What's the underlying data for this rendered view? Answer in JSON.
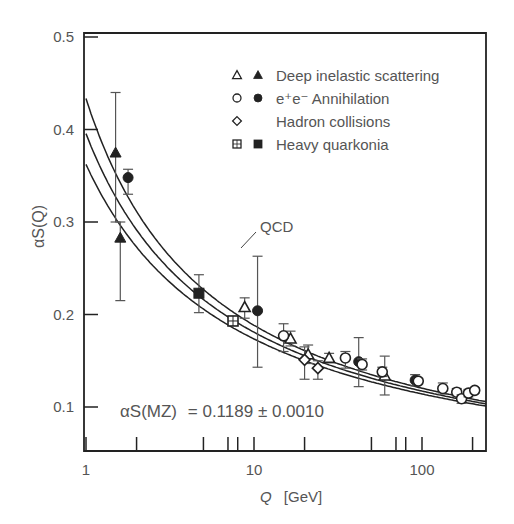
{
  "chart_data": {
    "type": "scatter",
    "title": "",
    "xlabel": "Q [GeV]",
    "xlabel_var": "Q",
    "xlabel_unit": "[GeV]",
    "ylabel": "αS(Q)",
    "xscale": "log",
    "xlim": [
      1,
      250
    ],
    "ylim": [
      0.05,
      0.5
    ],
    "grid": false,
    "x_tick_labels": [
      "1",
      "10",
      "100"
    ],
    "x_ticks": [
      1,
      10,
      100
    ],
    "x_minor_ticks": [
      2,
      5,
      7,
      8,
      20,
      50,
      70,
      80,
      200
    ],
    "y_tick_labels": [
      "0.5",
      "0.4",
      "0.3",
      "0.2",
      "0.1"
    ],
    "y_ticks": [
      0.5,
      0.4,
      0.3,
      0.2,
      0.1
    ],
    "curve_label": "QCD",
    "annotation": {
      "lhs": "αS(MZ)",
      "rhs": "= 0.1189 ± 0.0010",
      "alpha_mz": 0.1189,
      "uncertainty": 0.001
    },
    "qcd_band": {
      "alpha_mz": 0.1189,
      "uncertainty": 0.001,
      "mz": 91.19,
      "lines": 3
    },
    "legend_position": "upper right",
    "legend": [
      {
        "label": "Deep inelastic scattering",
        "markers": [
          "open-triangle",
          "filled-triangle"
        ]
      },
      {
        "label": "e⁺e⁻ Annihilation",
        "markers": [
          "open-circle",
          "filled-circle"
        ]
      },
      {
        "label": "Hadron collisions",
        "markers": [
          "open-diamond"
        ]
      },
      {
        "label": "Heavy quarkonia",
        "markers": [
          "crossed-square",
          "filled-square"
        ]
      }
    ],
    "series": [
      {
        "name": "Deep inelastic scattering",
        "points": [
          {
            "q": 1.5,
            "alpha": 0.375,
            "err_hi": 0.44,
            "err_lo": 0.3,
            "marker": "filled-triangle"
          },
          {
            "q": 1.6,
            "alpha": 0.283,
            "err_hi": 0.3,
            "err_lo": 0.215,
            "marker": "filled-triangle"
          },
          {
            "q": 8.8,
            "alpha": 0.208,
            "err_hi": 0.218,
            "err_lo": 0.196,
            "marker": "open-triangle"
          },
          {
            "q": 16.5,
            "alpha": 0.174,
            "err_hi": 0.182,
            "err_lo": 0.166,
            "marker": "open-triangle"
          },
          {
            "q": 21,
            "alpha": 0.157,
            "err_hi": 0.167,
            "err_lo": 0.147,
            "marker": "open-triangle"
          },
          {
            "q": 28,
            "alpha": 0.153,
            "err_hi": 0.158,
            "err_lo": 0.148,
            "marker": "open-triangle"
          },
          {
            "q": 60,
            "alpha": 0.134,
            "err_hi": 0.155,
            "err_lo": 0.113,
            "marker": "open-triangle"
          }
        ]
      },
      {
        "name": "e+e- Annihilation",
        "points": [
          {
            "q": 1.78,
            "alpha": 0.348,
            "err_hi": 0.357,
            "err_lo": 0.33,
            "marker": "filled-circle"
          },
          {
            "q": 10.5,
            "alpha": 0.204,
            "err_hi": 0.263,
            "err_lo": 0.143,
            "marker": "filled-circle"
          },
          {
            "q": 15,
            "alpha": 0.177,
            "err_hi": 0.19,
            "err_lo": 0.16,
            "marker": "open-circle"
          },
          {
            "q": 35,
            "alpha": 0.153,
            "err_hi": 0.16,
            "err_lo": 0.142,
            "marker": "open-circle"
          },
          {
            "q": 42,
            "alpha": 0.149,
            "err_hi": 0.175,
            "err_lo": 0.122,
            "marker": "filled-circle"
          },
          {
            "q": 44,
            "alpha": 0.146,
            "err_hi": 0.152,
            "err_lo": 0.14,
            "marker": "open-circle"
          },
          {
            "q": 58,
            "alpha": 0.138,
            "err_hi": 0.143,
            "err_lo": 0.133,
            "marker": "open-circle"
          },
          {
            "q": 91,
            "alpha": 0.129,
            "err_hi": 0.135,
            "err_lo": 0.123,
            "marker": "filled-circle"
          },
          {
            "q": 95,
            "alpha": 0.128,
            "err_hi": 0.131,
            "err_lo": 0.125,
            "marker": "open-circle"
          },
          {
            "q": 133,
            "alpha": 0.12,
            "err_hi": 0.126,
            "err_lo": 0.114,
            "marker": "open-circle"
          },
          {
            "q": 161,
            "alpha": 0.116,
            "err_hi": 0.12,
            "err_lo": 0.112,
            "marker": "open-circle"
          },
          {
            "q": 172,
            "alpha": 0.109,
            "err_hi": 0.113,
            "err_lo": 0.104,
            "marker": "open-circle"
          },
          {
            "q": 189,
            "alpha": 0.115,
            "err_hi": 0.119,
            "err_lo": 0.111,
            "marker": "open-circle"
          },
          {
            "q": 206,
            "alpha": 0.118,
            "err_hi": 0.121,
            "err_lo": 0.115,
            "marker": "open-circle"
          }
        ]
      },
      {
        "name": "Hadron collisions",
        "points": [
          {
            "q": 20,
            "alpha": 0.151,
            "err_hi": 0.165,
            "err_lo": 0.13,
            "marker": "open-diamond"
          },
          {
            "q": 24,
            "alpha": 0.142,
            "err_hi": 0.15,
            "err_lo": 0.13,
            "marker": "open-diamond"
          }
        ]
      },
      {
        "name": "Heavy quarkonia",
        "points": [
          {
            "q": 4.7,
            "alpha": 0.223,
            "err_hi": 0.243,
            "err_lo": 0.202,
            "marker": "filled-square"
          },
          {
            "q": 7.5,
            "alpha": 0.193,
            "err_hi": 0.196,
            "err_lo": 0.19,
            "marker": "crossed-square"
          }
        ]
      }
    ]
  },
  "colors": {
    "ink": "#222222",
    "text": "#555555",
    "background": "#ffffff"
  }
}
